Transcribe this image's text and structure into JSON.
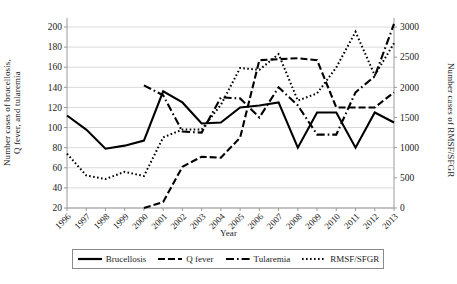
{
  "chart_data": {
    "type": "line",
    "title": "",
    "xlabel": "Year",
    "ylabel": "Number cases of brucellosis,\nQ fever, and tularemia",
    "ylabel_right": "Number cases of RMSF/SFGR",
    "x": [
      1996,
      1997,
      1998,
      1999,
      2000,
      2001,
      2002,
      2003,
      2004,
      2005,
      2006,
      2007,
      2008,
      2009,
      2010,
      2011,
      2012,
      2013
    ],
    "xtick_labels": [
      "1996",
      "1997",
      "1998",
      "1999",
      "2000",
      "2001",
      "2002",
      "2003",
      "2004",
      "2005",
      "2006",
      "2007",
      "2008",
      "2009",
      "2010",
      "2011",
      "2012",
      "2013"
    ],
    "ylim": [
      20,
      200
    ],
    "ytick_labels": [
      "20",
      "40",
      "60",
      "80",
      "100",
      "120",
      "140",
      "160",
      "180",
      "200"
    ],
    "yticks": [
      20,
      40,
      60,
      80,
      100,
      120,
      140,
      160,
      180,
      200
    ],
    "ylim_right": [
      0,
      3000
    ],
    "ytick_labels_right": [
      "0",
      "500",
      "1000",
      "1500",
      "2000",
      "2500",
      "3000"
    ],
    "yticks_right": [
      0,
      500,
      1000,
      1500,
      2000,
      2500,
      3000
    ],
    "grid": true,
    "legend_position": "bottom",
    "series": [
      {
        "name": "Brucellosis",
        "axis": "left",
        "style": "solid",
        "color": "#000000",
        "values": [
          112,
          98,
          79,
          82,
          87,
          136,
          125,
          104,
          105,
          120,
          122,
          125,
          80,
          115,
          115,
          80,
          115,
          105
        ]
      },
      {
        "name": "Q fever",
        "axis": "left",
        "style": "dashed",
        "color": "#000000",
        "values": [
          null,
          null,
          null,
          null,
          20,
          26,
          61,
          71,
          70,
          90,
          167,
          168,
          169,
          167,
          120,
          120,
          120,
          135
        ]
      },
      {
        "name": "Tularemia",
        "axis": "left",
        "style": "dashdot",
        "color": "#000000",
        "values": [
          null,
          null,
          null,
          null,
          142,
          132,
          96,
          95,
          130,
          129,
          110,
          140,
          122,
          93,
          93,
          135,
          151,
          203
        ]
      },
      {
        "name": "RMSF/SFGR",
        "axis": "right",
        "style": "dotted",
        "color": "#000000",
        "values": [
          900,
          540,
          480,
          600,
          530,
          1170,
          1300,
          1300,
          1710,
          2320,
          2290,
          2550,
          1780,
          1900,
          2330,
          2920,
          2200,
          2730
        ]
      }
    ]
  },
  "legend": {
    "entries": [
      {
        "label": "Brucellosis",
        "style": "solid"
      },
      {
        "label": "Q fever",
        "style": "dashed"
      },
      {
        "label": "Tularemia",
        "style": "dashdot"
      },
      {
        "label": "RMSF/SFGR",
        "style": "dotted"
      }
    ]
  },
  "colors": {
    "line": "#000000",
    "grid": "#d9d9d9",
    "axis": "#9a9a9a",
    "text": "#1a1a1a"
  }
}
